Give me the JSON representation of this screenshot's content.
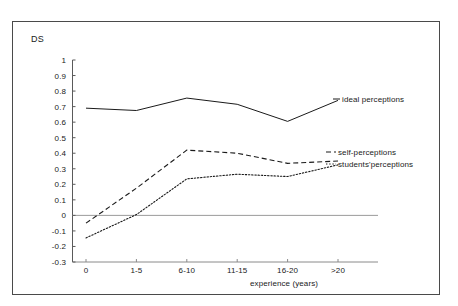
{
  "chart_data": {
    "type": "line",
    "title": "",
    "xlabel": "experience (years)",
    "ylabel": "DS",
    "categories": [
      "0",
      "1-5",
      "6-10",
      "11-15",
      "16-20",
      ">20"
    ],
    "ylim": [
      -0.3,
      1
    ],
    "xlim": [
      -0.35,
      5.6
    ],
    "grid": false,
    "legend_position": "right-inline",
    "yticks": [
      "1",
      "0.9",
      "0.8",
      "0.7",
      "0.6",
      "0.5",
      "0.4",
      "0.3",
      "0.2",
      "0.1",
      "0",
      "-0.1",
      "-0.2",
      "-0.3"
    ],
    "ytick_values": [
      1,
      0.9,
      0.8,
      0.7,
      0.6,
      0.5,
      0.4,
      0.3,
      0.2,
      0.1,
      0,
      -0.1,
      -0.2,
      -0.3
    ],
    "zero_line": 0,
    "series": [
      {
        "name": "ideal perceptions",
        "style": "solid",
        "color": "#1a1a1a",
        "values": [
          0.69,
          0.675,
          0.755,
          0.715,
          0.605,
          0.74
        ]
      },
      {
        "name": "self-perceptions",
        "style": "dashed",
        "color": "#1a1a1a",
        "values": [
          -0.05,
          0.175,
          0.42,
          0.4,
          0.335,
          0.35
        ]
      },
      {
        "name": "students'perceptions",
        "style": "dotted",
        "color": "#1a1a1a",
        "values": [
          -0.145,
          0.005,
          0.235,
          0.265,
          0.25,
          0.325
        ]
      }
    ]
  },
  "legend": {
    "items": [
      {
        "label": "ideal perceptions"
      },
      {
        "label": "self-perceptions"
      },
      {
        "label": "students'perceptions"
      }
    ]
  }
}
